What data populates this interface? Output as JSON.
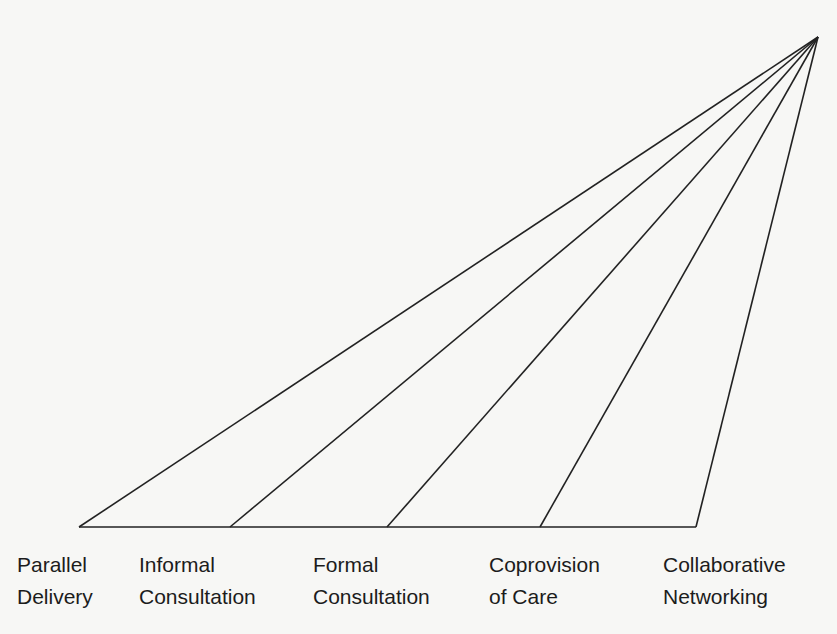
{
  "diagram": {
    "type": "fan-continuum",
    "line_color": "#222222",
    "apex": {
      "x": 818,
      "y": 37
    },
    "baseline": {
      "y": 527,
      "x_start": 79,
      "x_end": 696
    },
    "rays": [
      {
        "x": 79
      },
      {
        "x": 230
      },
      {
        "x": 387
      },
      {
        "x": 540
      },
      {
        "x": 696
      }
    ],
    "labels": [
      {
        "line1": "Parallel",
        "line2": "Delivery",
        "x": 17
      },
      {
        "line1": "Informal",
        "line2": "Consultation",
        "x": 139
      },
      {
        "line1": "Formal",
        "line2": "Consultation",
        "x": 313
      },
      {
        "line1": "Coprovision",
        "line2": "of Care",
        "x": 489
      },
      {
        "line1": "Collaborative",
        "line2": "Networking",
        "x": 663
      }
    ]
  }
}
